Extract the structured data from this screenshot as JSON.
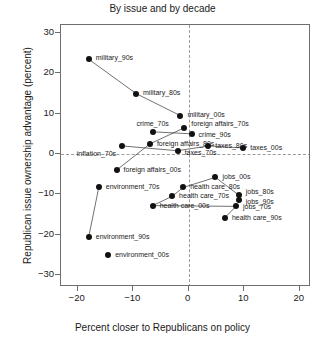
{
  "chart_data": {
    "type": "scatter",
    "title": "By issue and by decade",
    "xlabel": "Percent closer to Republicans on policy",
    "ylabel": "Republican issue ownership advantage (percent)",
    "xlim": [
      -23,
      22
    ],
    "ylim": [
      -33,
      32
    ],
    "xticks": [
      -20,
      -10,
      0,
      10,
      20
    ],
    "yticks": [
      30,
      20,
      10,
      0,
      -10,
      -20,
      -30
    ],
    "xticklabels": [
      "−20",
      "−10",
      "0",
      "10",
      "20"
    ],
    "yticklabels": [
      "30",
      "20",
      "10",
      "0",
      "−10",
      "−20",
      "−30"
    ],
    "grid": false,
    "legend": null,
    "reference_lines": [
      {
        "axis": "x",
        "value": 0,
        "style": "dashed"
      },
      {
        "axis": "y",
        "value": 0,
        "style": "dashed"
      }
    ],
    "points": [
      {
        "label": "military_90s",
        "x": -18.0,
        "y": 23.5,
        "label_dx": 7,
        "label_dy": -1
      },
      {
        "label": "military_80s",
        "x": -9.5,
        "y": 15.0,
        "label_dx": 7,
        "label_dy": -1
      },
      {
        "label": "military_00s",
        "x": -1.5,
        "y": 9.5,
        "label_dx": 7,
        "label_dy": -1
      },
      {
        "label": "crime_70s",
        "x": -6.5,
        "y": 5.5,
        "label_dx": 0,
        "label_dy": -8,
        "label_align": "center"
      },
      {
        "label": "foreign affairs_70s",
        "x": -0.8,
        "y": 6.5,
        "label_dx": 7,
        "label_dy": -4
      },
      {
        "label": "crime_90s",
        "x": 0.5,
        "y": 5.0,
        "label_dx": 7,
        "label_dy": 1
      },
      {
        "label": "foreign affairs_80s",
        "x": -7.0,
        "y": 2.5,
        "label_dx": 7,
        "label_dy": 0
      },
      {
        "label": "taxes_80s",
        "x": 3.5,
        "y": 2.0,
        "label_dx": 7,
        "label_dy": 0
      },
      {
        "label": "inflation_70s",
        "x": -12.0,
        "y": 2.0,
        "label_dx": -6,
        "label_dy": 8,
        "label_align": "right"
      },
      {
        "label": "taxes_70s",
        "x": -2.0,
        "y": 0.8,
        "label_dx": 7,
        "label_dy": 2
      },
      {
        "label": "taxes_00s",
        "x": 9.8,
        "y": 1.5,
        "label_dx": 7,
        "label_dy": 0
      },
      {
        "label": "foreign affairs_00s",
        "x": -13.0,
        "y": -4.0,
        "label_dx": 7,
        "label_dy": 0
      },
      {
        "label": "environment_70s",
        "x": -16.2,
        "y": -8.3,
        "label_dx": 7,
        "label_dy": 0
      },
      {
        "label": "health care_80s",
        "x": -1.0,
        "y": -8.3,
        "label_dx": 7,
        "label_dy": 0
      },
      {
        "label": "health care_70s",
        "x": -3.0,
        "y": -10.5,
        "label_dx": 7,
        "label_dy": 0
      },
      {
        "label": "health care_00s",
        "x": -6.5,
        "y": -12.8,
        "label_dx": 7,
        "label_dy": 0
      },
      {
        "label": "jobs_00s",
        "x": 4.8,
        "y": -5.8,
        "label_dx": 7,
        "label_dy": 0
      },
      {
        "label": "jobs_80s",
        "x": 9.0,
        "y": -10.2,
        "label_dx": 7,
        "label_dy": -3
      },
      {
        "label": "jobs_90s",
        "x": 9.0,
        "y": -11.3,
        "label_dx": 7,
        "label_dy": 2
      },
      {
        "label": "jobs_70s",
        "x": 8.5,
        "y": -13.0,
        "label_dx": 7,
        "label_dy": 1
      },
      {
        "label": "health care_90s",
        "x": 6.5,
        "y": -15.8,
        "label_dx": 7,
        "label_dy": 0
      },
      {
        "label": "environment_90s",
        "x": -18.0,
        "y": -20.5,
        "label_dx": 7,
        "label_dy": 0
      },
      {
        "label": "environment_00s",
        "x": -14.5,
        "y": -25.0,
        "label_dx": 7,
        "label_dy": 0
      }
    ],
    "connections": [
      [
        "military_90s",
        "military_80s"
      ],
      [
        "military_80s",
        "military_00s"
      ],
      [
        "crime_70s",
        "crime_90s"
      ],
      [
        "foreign affairs_80s",
        "foreign affairs_70s"
      ],
      [
        "inflation_70s",
        "taxes_70s"
      ],
      [
        "taxes_70s",
        "taxes_80s"
      ],
      [
        "taxes_80s",
        "taxes_00s"
      ],
      [
        "foreign affairs_00s",
        "foreign affairs_80s"
      ],
      [
        "health care_00s",
        "health care_70s"
      ],
      [
        "health care_70s",
        "health care_80s"
      ],
      [
        "health care_80s",
        "jobs_00s"
      ],
      [
        "jobs_00s",
        "jobs_80s"
      ],
      [
        "health care_00s",
        "jobs_70s"
      ],
      [
        "jobs_70s",
        "health care_90s"
      ],
      [
        "environment_90s",
        "environment_70s"
      ]
    ]
  }
}
